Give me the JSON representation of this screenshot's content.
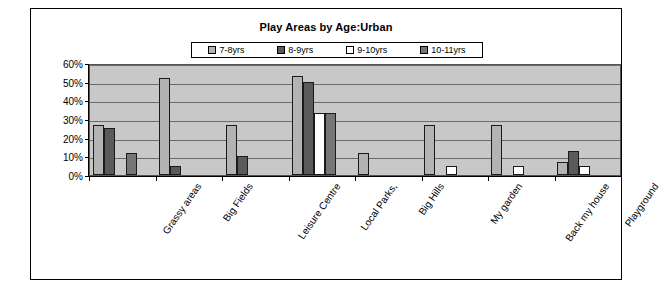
{
  "chart_data": {
    "type": "bar",
    "title": "Play Areas by Age:Urban",
    "xlabel": "",
    "ylabel": "",
    "ylim": [
      0,
      60
    ],
    "ytick_labels": [
      "60%",
      "50%",
      "40%",
      "30%",
      "20%",
      "10%",
      "0%"
    ],
    "ytick_values": [
      60,
      50,
      40,
      30,
      20,
      10,
      0
    ],
    "grid": true,
    "legend_position": "top-center",
    "categories": [
      "Grassy areas",
      "Big Fields",
      "Leisure Centre",
      "Local Parks,",
      "Big Hills",
      "My garden",
      "Back my house",
      "Playground"
    ],
    "series": [
      {
        "name": "7-8yrs",
        "color": "#b3b3b3",
        "values": [
          27,
          52,
          27,
          53,
          12,
          27,
          27,
          7
        ]
      },
      {
        "name": "8-9yrs",
        "color": "#5a5a5a",
        "values": [
          25,
          5,
          10,
          50,
          0,
          0,
          0,
          13
        ]
      },
      {
        "name": "9-10yrs",
        "color": "#ffffff",
        "values": [
          0,
          0,
          0,
          33,
          0,
          5,
          5,
          5
        ]
      },
      {
        "name": "10-11yrs",
        "color": "#767676",
        "values": [
          12,
          0,
          0,
          33,
          0,
          0,
          0,
          0
        ]
      }
    ]
  },
  "legend": {
    "entries": [
      {
        "label": "7-8yrs",
        "color": "#b3b3b3"
      },
      {
        "label": "8-9yrs",
        "color": "#5a5a5a"
      },
      {
        "label": "9-10yrs",
        "color": "#ffffff"
      },
      {
        "label": "10-11yrs",
        "color": "#767676"
      }
    ]
  },
  "colors": {
    "plot_background": "#c8c8c8",
    "gridline": "#6b6b6b",
    "axis": "#000000",
    "bar_outline": "#1a1a1a",
    "frame_border": "#000000"
  }
}
